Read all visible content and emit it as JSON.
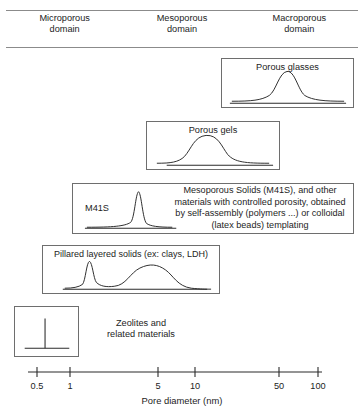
{
  "header": {
    "domains": [
      {
        "line1": "Microporous",
        "line2": "domain"
      },
      {
        "line1": "Mesoporous",
        "line2": "domain"
      },
      {
        "line1": "Macroporous",
        "line2": "domain"
      }
    ]
  },
  "panels": {
    "porous_glasses": {
      "caption": "Porous glasses"
    },
    "porous_gels": {
      "caption": "Porous gels"
    },
    "m41s": {
      "peak_label": "M41S",
      "description_lines": [
        "Mesoporous Solids (M41S), and other",
        "materials with controlled porosity, obtained",
        "by self-assembly (polymers ...) or colloidal",
        "(latex beads) templating"
      ]
    },
    "pillared": {
      "caption": "Pillared layered solids (ex: clays, LDH)"
    },
    "zeolites": {
      "line1": "Zeolites and",
      "line2": "related materials"
    }
  },
  "axis": {
    "label": "Pore diameter (nm)",
    "ticks": [
      {
        "value": "0.5",
        "x": 37
      },
      {
        "value": "1",
        "x": 70
      },
      {
        "value": "5",
        "x": 158
      },
      {
        "value": "10",
        "x": 195
      },
      {
        "value": "50",
        "x": 279
      },
      {
        "value": "100",
        "x": 318
      }
    ],
    "line": {
      "x1": 28,
      "x2": 322,
      "y": 12
    }
  },
  "colors": {
    "ink": "#1a1a1a",
    "curve": "#2b2b2b",
    "box_border": "#6e6e6e",
    "rule": "#8b8b8b",
    "background": "#ffffff"
  },
  "chart_data": {
    "type": "line",
    "xlabel": "Pore diameter (nm)",
    "ylabel": "",
    "xscale": "log",
    "xlim": [
      0.4,
      120
    ],
    "xticks": [
      0.5,
      1,
      5,
      10,
      50,
      100
    ],
    "grid": false,
    "legend": "none",
    "series": [
      {
        "name": "Zeolites and related materials",
        "shape": "sharp-spike",
        "peak_nm": 0.8,
        "range_nm": [
          0.5,
          1.3
        ],
        "panel": "zeolites"
      },
      {
        "name": "Pillared layered solids (ex: clays, LDH)",
        "shape": "bimodal",
        "peaks_nm": [
          1.1,
          4.0
        ],
        "range_nm": [
          0.6,
          20
        ],
        "panel": "pillared"
      },
      {
        "name": "M41S",
        "shape": "narrow-asymmetric",
        "peak_nm": 2.6,
        "range_nm": [
          1.5,
          8
        ],
        "panel": "m41s"
      },
      {
        "name": "Porous gels",
        "shape": "broad-gaussian",
        "peak_nm": 11,
        "range_nm": [
          3,
          60
        ],
        "panel": "porous_gels"
      },
      {
        "name": "Porous glasses",
        "shape": "gaussian",
        "peak_nm": 40,
        "range_nm": [
          12,
          120
        ],
        "panel": "porous_glasses"
      }
    ],
    "domains": [
      {
        "name": "Microporous domain",
        "range_nm": [
          0.4,
          2
        ]
      },
      {
        "name": "Mesoporous domain",
        "range_nm": [
          2,
          50
        ]
      },
      {
        "name": "Macroporous domain",
        "range_nm": [
          50,
          120
        ]
      }
    ]
  }
}
